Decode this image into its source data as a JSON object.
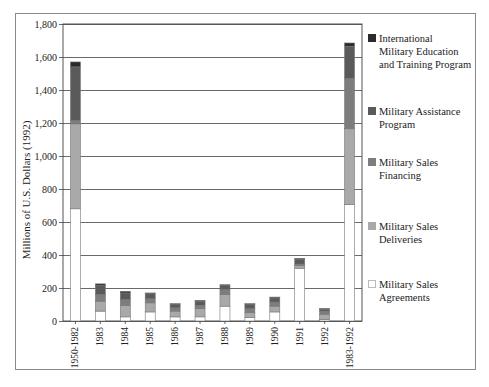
{
  "chart_data": {
    "type": "bar",
    "stacked": true,
    "title": "",
    "xlabel": "",
    "ylabel": "Millions of U.S. Dollars (1992)",
    "ylim": [
      0,
      1800
    ],
    "yticks": [
      0,
      200,
      400,
      600,
      800,
      1000,
      1200,
      1400,
      1600,
      1800
    ],
    "ytick_labels": [
      "0",
      "200",
      "400",
      "600",
      "800",
      "1,000",
      "1,200",
      "1,400",
      "1,600",
      "1,800"
    ],
    "grid": true,
    "legend_position": "right",
    "categories": [
      "1950-1982",
      "1983",
      "1984",
      "1985",
      "1986",
      "1987",
      "1988",
      "1989",
      "1990",
      "1991",
      "1992",
      "1983-1992"
    ],
    "series": [
      {
        "name": "Military Sales Agreements",
        "color": "#ffffff",
        "values": [
          680,
          60,
          25,
          55,
          25,
          25,
          90,
          20,
          55,
          320,
          10,
          705
        ]
      },
      {
        "name": "Military Sales Deliveries",
        "color": "#a9a9a9",
        "values": [
          515,
          60,
          70,
          55,
          35,
          50,
          70,
          30,
          35,
          15,
          30,
          460
        ]
      },
      {
        "name": "Military Sales Financing",
        "color": "#7d7d7d",
        "values": [
          20,
          40,
          35,
          25,
          20,
          20,
          30,
          25,
          25,
          10,
          20,
          305
        ]
      },
      {
        "name": "Military Assistance Program",
        "color": "#5a5a5a",
        "values": [
          325,
          55,
          40,
          30,
          20,
          25,
          25,
          25,
          25,
          30,
          12,
          195
        ]
      },
      {
        "name": "International Military Education and Training Program",
        "color": "#2b2b2b",
        "values": [
          30,
          10,
          10,
          5,
          5,
          5,
          5,
          5,
          5,
          5,
          3,
          20
        ]
      }
    ]
  },
  "legend": {
    "items": [
      {
        "label": "International\nMilitary Education\nand Training Program",
        "color": "#2b2b2b"
      },
      {
        "label": "Military Assistance\nProgram",
        "color": "#5a5a5a"
      },
      {
        "label": "Military Sales\nFinancing",
        "color": "#7d7d7d"
      },
      {
        "label": "Military Sales\nDeliveries",
        "color": "#a9a9a9"
      },
      {
        "label": "Military Sales\nAgreements",
        "color": "#ffffff"
      }
    ]
  }
}
